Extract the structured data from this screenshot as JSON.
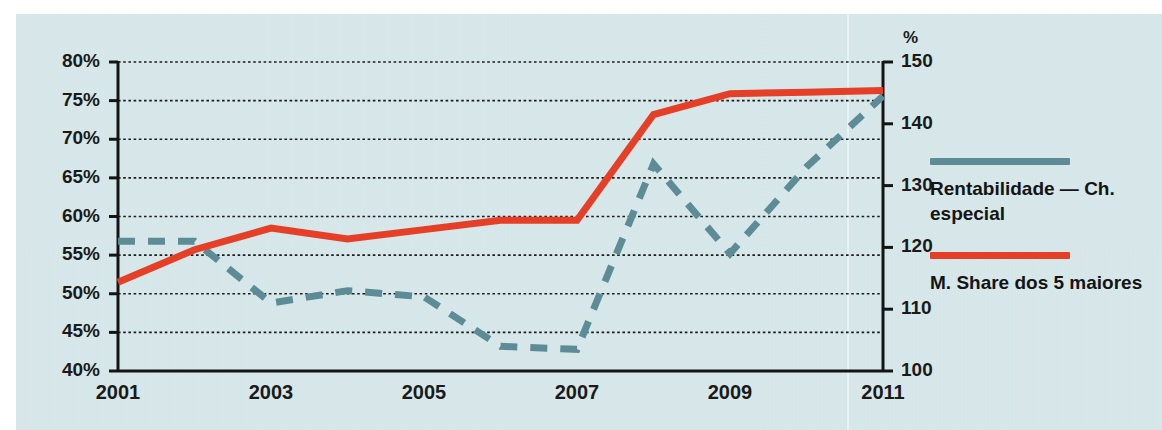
{
  "figure": {
    "background_color": "#d7e8ea",
    "axis_color": "#1a1a1a"
  },
  "axes": {
    "left_unit": "",
    "right_unit": "%",
    "left_ticks": [
      "80%",
      "75%",
      "70%",
      "65%",
      "60%",
      "55%",
      "50%",
      "45%",
      "40%"
    ],
    "right_ticks": [
      "150",
      "140",
      "130",
      "120",
      "110",
      "100"
    ],
    "x_ticks": [
      "2001",
      "2003",
      "2005",
      "2007",
      "2009",
      "2011"
    ]
  },
  "legend": {
    "position": "right",
    "entries": [
      {
        "label": "Rentabilidade — Ch. especial",
        "color": "#5d8c97",
        "style": "dashed"
      },
      {
        "label": "M. Share dos 5 maiores",
        "color": "#e63f27",
        "style": "solid"
      }
    ]
  },
  "chart_data": {
    "type": "line",
    "title": "",
    "subtitle": "",
    "xlabel": "",
    "ylabel": "",
    "grid": true,
    "legend_position": "right",
    "x": [
      2001,
      2002,
      2003,
      2004,
      2005,
      2006,
      2007,
      2008,
      2009,
      2010,
      2011
    ],
    "x_tick_labels": [
      "2001",
      "2003",
      "2005",
      "2007",
      "2009",
      "2011"
    ],
    "x_tick_values": [
      2001,
      2003,
      2005,
      2007,
      2009,
      2011
    ],
    "xlim": [
      2001,
      2011
    ],
    "axis_left": {
      "label": "",
      "unit": "%",
      "ylim": [
        40,
        80
      ],
      "ticks": [
        40,
        45,
        50,
        55,
        60,
        65,
        70,
        75,
        80
      ],
      "tick_labels": [
        "40%",
        "45%",
        "50%",
        "55%",
        "60%",
        "65%",
        "70%",
        "75%",
        "80%"
      ]
    },
    "axis_right": {
      "label": "",
      "unit": "%",
      "ylim": [
        100,
        150
      ],
      "ticks": [
        100,
        110,
        120,
        130,
        140,
        150
      ],
      "tick_labels": [
        "100",
        "110",
        "120",
        "130",
        "140",
        "150"
      ]
    },
    "series": [
      {
        "name": "Rentabilidade — Ch. especial",
        "color": "#5d8c97",
        "style": "dashed",
        "axis": "right",
        "values_right_axis": [
          121,
          121,
          111,
          113,
          112,
          104,
          103.5,
          133.5,
          119,
          133,
          144.5
        ],
        "values_left_axis_scale": [
          56.8,
          56.8,
          48.8,
          50.4,
          49.6,
          43.2,
          42.8,
          66.8,
          55.2,
          66.4,
          75.6
        ]
      },
      {
        "name": "M. Share dos 5 maiores",
        "color": "#e63f27",
        "style": "solid",
        "axis": "left",
        "values": [
          51.5,
          55.7,
          58.5,
          57.1,
          58.3,
          59.5,
          59.5,
          73.2,
          75.9,
          76.1,
          76.3
        ]
      }
    ]
  }
}
